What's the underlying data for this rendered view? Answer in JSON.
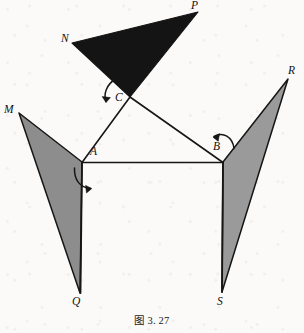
{
  "figure": {
    "caption": "图 3. 27",
    "canvas": {
      "width": 304,
      "height": 333
    },
    "colors": {
      "background": "#fbfaf8",
      "stroke": "#161616",
      "black_flap_fill": "#141414",
      "gray_flap_fill": "#8d8d8d",
      "gray_flap_fill_light": "#9a9a9a",
      "label_color": "#111111"
    },
    "points": {
      "A": {
        "x": 82,
        "y": 162,
        "label": "A",
        "label_x": 90,
        "label_y": 146
      },
      "B": {
        "x": 223,
        "y": 162,
        "label": "B",
        "label_x": 213,
        "label_y": 141
      },
      "C": {
        "x": 130,
        "y": 97,
        "label": "C",
        "label_x": 117,
        "label_y": 93
      },
      "M": {
        "x": 19,
        "y": 113,
        "label": "M",
        "label_x": 4,
        "label_y": 104
      },
      "N": {
        "x": 72,
        "y": 43,
        "label": "N",
        "label_x": 61,
        "label_y": 33
      },
      "P": {
        "x": 198,
        "y": 12,
        "label": "P",
        "label_x": 191,
        "label_y": 0
      },
      "Q": {
        "x": 80,
        "y": 293,
        "label": "Q",
        "label_x": 72,
        "label_y": 296
      },
      "R": {
        "x": 288,
        "y": 79,
        "label": "R",
        "label_x": 288,
        "label_y": 65
      },
      "S": {
        "x": 222,
        "y": 292,
        "label": "S",
        "label_x": 217,
        "label_y": 296
      }
    },
    "shapes": [
      {
        "name": "black-flap-NPC",
        "kind": "filled-triangle",
        "vertices": "N,P,C",
        "fill": "#141414",
        "stroke": "#141414"
      },
      {
        "name": "gray-flap-MAQ",
        "kind": "filled-triangle",
        "vertices": "M,A,Q",
        "fill": "#8d8d8d",
        "stroke": "#161616"
      },
      {
        "name": "gray-flap-BRS",
        "kind": "filled-triangle",
        "vertices": "B,R,S",
        "fill": "#9a9a9a",
        "stroke": "#161616"
      }
    ],
    "segments": [
      {
        "name": "segment-AB",
        "from": "A",
        "to": "B"
      },
      {
        "name": "segment-AC",
        "from": "A",
        "to": "C"
      },
      {
        "name": "segment-CB",
        "from": "C",
        "to": "B"
      },
      {
        "name": "segment-AQ",
        "from": "A",
        "to": "Q"
      },
      {
        "name": "segment-BS",
        "from": "B",
        "to": "S"
      }
    ],
    "rotation_arrows": [
      {
        "name": "rotation-arrow-at-C",
        "near_point": "C",
        "direction": "counterclockwise-down-left"
      },
      {
        "name": "rotation-arrow-at-A",
        "near_point": "A",
        "direction": "clockwise-right"
      },
      {
        "name": "rotation-arrow-at-B",
        "near_point": "B",
        "direction": "clockwise-down-right"
      }
    ]
  }
}
